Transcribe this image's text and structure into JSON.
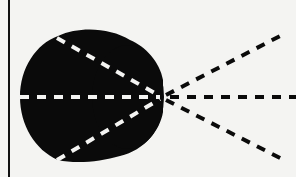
{
  "diagram": {
    "background": "#f4f4f2",
    "ink": "#0a0a0a",
    "inner_dash": "#f4f4f2",
    "border_line": {
      "x": 9,
      "y1": 0,
      "y2": 177
    },
    "blob": {
      "description": "solid black rounded shape with a larger left lobe and smaller right lobe",
      "vertex": {
        "x": 163,
        "y": 97
      }
    },
    "rays": [
      {
        "name": "upper-ray",
        "from": [
          57,
          38
        ],
        "to": [
          280,
          36
        ]
      },
      {
        "name": "middle-ray",
        "from": [
          20,
          97
        ],
        "to": [
          296,
          97
        ]
      },
      {
        "name": "lower-ray",
        "from": [
          57,
          160
        ],
        "to": [
          280,
          158
        ]
      }
    ]
  }
}
